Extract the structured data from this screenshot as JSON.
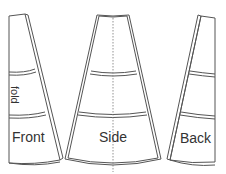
{
  "diagram": {
    "type": "sewing-pattern",
    "pieces": [
      {
        "id": "front",
        "label": "Front",
        "annotation": "fold"
      },
      {
        "id": "side",
        "label": "Side"
      },
      {
        "id": "back",
        "label": "Back"
      }
    ],
    "colors": {
      "stroke": "#555555",
      "text": "#333333",
      "background": "#ffffff"
    }
  }
}
